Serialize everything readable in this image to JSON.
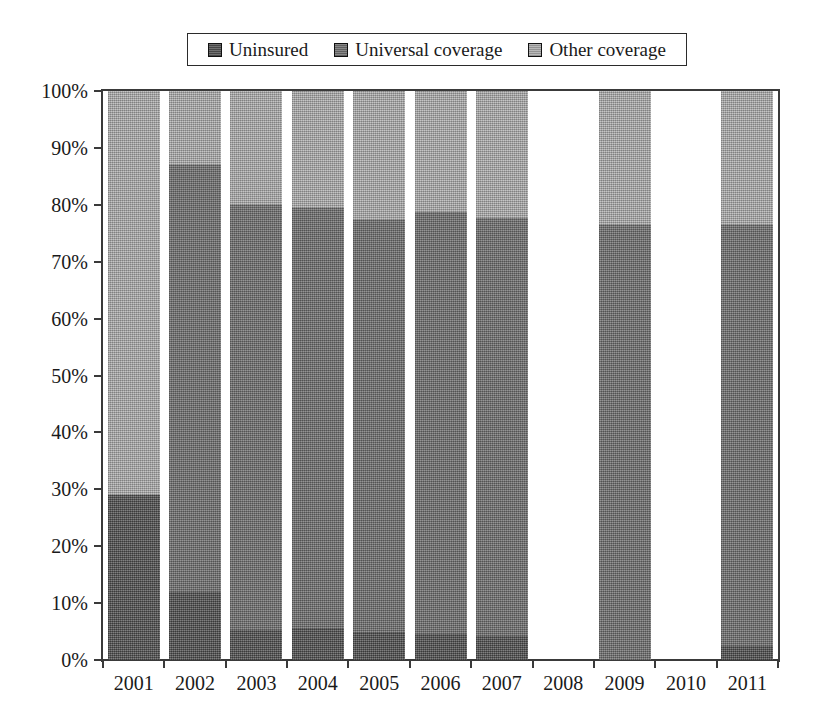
{
  "chart_data": {
    "type": "bar",
    "subtype": "stacked-100-percent",
    "title": "",
    "xlabel": "",
    "ylabel": "",
    "ylim": [
      0,
      100
    ],
    "ytick_labels": [
      "100%",
      "90%",
      "80%",
      "70%",
      "60%",
      "50%",
      "40%",
      "30%",
      "20%",
      "10%",
      "0%"
    ],
    "ytick_values": [
      100,
      90,
      80,
      70,
      60,
      50,
      40,
      30,
      20,
      10,
      0
    ],
    "grid": false,
    "legend_position": "top-center",
    "categories": [
      "2001",
      "2002",
      "2003",
      "2004",
      "2005",
      "2006",
      "2007",
      "2008",
      "2009",
      "2010",
      "2011"
    ],
    "series": [
      {
        "name": "Uninsured",
        "color": "#5d5d5d",
        "values": [
          29.0,
          12.0,
          5.3,
          5.5,
          4.8,
          4.5,
          4.2,
          null,
          0.0,
          null,
          2.5
        ]
      },
      {
        "name": "Universal coverage",
        "color": "#767676",
        "values": [
          0.0,
          75.0,
          74.7,
          73.9,
          72.5,
          74.2,
          73.5,
          null,
          76.5,
          null,
          74.0
        ]
      },
      {
        "name": "Other coverage",
        "color": "#a6a6a6",
        "values": [
          71.0,
          13.0,
          20.0,
          20.6,
          22.7,
          21.3,
          22.3,
          null,
          23.5,
          null,
          23.5
        ]
      }
    ],
    "missing_categories": [
      "2008",
      "2010"
    ]
  },
  "legend": {
    "entries": [
      {
        "label": "Uninsured",
        "swatch_class": "sw-uninsured"
      },
      {
        "label": "Universal coverage",
        "swatch_class": "sw-universal"
      },
      {
        "label": "Other coverage",
        "swatch_class": "sw-other"
      }
    ]
  }
}
